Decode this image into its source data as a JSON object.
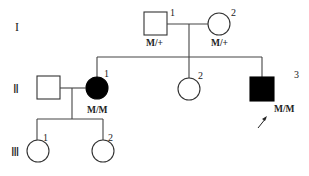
{
  "diagram": {
    "type": "pedigree",
    "generations": [
      {
        "label": "I",
        "x": 18,
        "y": 31
      },
      {
        "label": "Ⅱ",
        "x": 16,
        "y": 93
      },
      {
        "label": "Ⅲ",
        "x": 14,
        "y": 156
      }
    ],
    "individuals": [
      {
        "id": "I-1",
        "sex": "male",
        "affected": false,
        "number": "1",
        "genotype": "M/+"
      },
      {
        "id": "I-2",
        "sex": "female",
        "affected": false,
        "number": "2",
        "genotype": "M/+"
      },
      {
        "id": "II-spouse",
        "sex": "male",
        "affected": false,
        "number": "",
        "genotype": ""
      },
      {
        "id": "II-1",
        "sex": "female",
        "affected": true,
        "number": "1",
        "genotype": "M/M"
      },
      {
        "id": "II-2",
        "sex": "female",
        "affected": false,
        "number": "2",
        "genotype": ""
      },
      {
        "id": "II-3",
        "sex": "male",
        "affected": true,
        "number": "3",
        "genotype": "M/M",
        "proband": true
      },
      {
        "id": "III-1",
        "sex": "female",
        "affected": false,
        "number": "1",
        "genotype": ""
      },
      {
        "id": "III-2",
        "sex": "female",
        "affected": false,
        "number": "2",
        "genotype": ""
      }
    ],
    "colors": {
      "affected": "#000000",
      "unaffected": "#ffffff",
      "line": "#444444"
    }
  }
}
